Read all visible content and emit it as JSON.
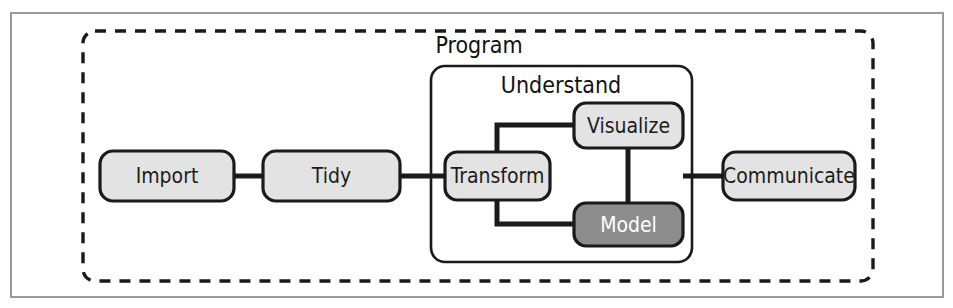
{
  "figure": {
    "canvas": {
      "width": 953,
      "height": 308,
      "background": "#ffffff"
    },
    "frame": {
      "name": "outer-frame",
      "x": 11,
      "y": 13,
      "width": 932,
      "height": 284,
      "stroke": "#9a9a9a",
      "stroke_width": 2,
      "fill": "#ffffff"
    },
    "colors": {
      "node_fill": "#e3e3e3",
      "node_stroke": "#1a1a1a",
      "node_text": "#1c1c1c",
      "highlight_fill": "#8d8d8d",
      "highlight_text": "#ffffff",
      "group_stroke": "#1a1a1a",
      "dashed_stroke": "#1a1a1a",
      "connector_stroke": "#1a1a1a",
      "frame_stroke": "#9a9a9a"
    },
    "groups": [
      {
        "id": "program",
        "label": "Program",
        "style": "dashed",
        "x": 83,
        "y": 31,
        "width": 790,
        "height": 250,
        "rx": 12,
        "label_x": 479,
        "label_y": 46
      },
      {
        "id": "understand",
        "label": "Understand",
        "style": "solid",
        "x": 431,
        "y": 66,
        "width": 261,
        "height": 196,
        "rx": 14,
        "label_x": 561,
        "label_y": 86
      }
    ],
    "nodes": [
      {
        "id": "import",
        "label": "Import",
        "x": 100,
        "y": 151,
        "width": 134,
        "height": 50,
        "rx": 13,
        "variant": "light"
      },
      {
        "id": "tidy",
        "label": "Tidy",
        "x": 263,
        "y": 151,
        "width": 137,
        "height": 50,
        "rx": 13,
        "variant": "light"
      },
      {
        "id": "transform",
        "label": "Transform",
        "x": 445,
        "y": 152,
        "width": 105,
        "height": 48,
        "rx": 12,
        "variant": "light"
      },
      {
        "id": "visualize",
        "label": "Visualize",
        "x": 574,
        "y": 103,
        "width": 109,
        "height": 45,
        "rx": 12,
        "variant": "light"
      },
      {
        "id": "model",
        "label": "Model",
        "x": 574,
        "y": 203,
        "width": 109,
        "height": 43,
        "rx": 12,
        "variant": "dark"
      },
      {
        "id": "communicate",
        "label": "Communicate",
        "x": 723,
        "y": 152,
        "width": 132,
        "height": 48,
        "rx": 13,
        "variant": "light"
      }
    ],
    "connectors": [
      {
        "id": "import-to-tidy",
        "from": "import",
        "to": "tidy",
        "points": "234,176 263,176"
      },
      {
        "id": "tidy-to-transform",
        "from": "tidy",
        "to": "transform",
        "points": "400,176 445,176"
      },
      {
        "id": "transform-to-visualize",
        "from": "transform",
        "to": "visualize",
        "points": "497,176 497,125 574,125"
      },
      {
        "id": "transform-to-model",
        "from": "transform",
        "to": "model",
        "points": "497,176 497,224 574,224"
      },
      {
        "id": "visualize-to-model",
        "from": "visualize",
        "to": "model",
        "points": "628,148 628,203"
      },
      {
        "id": "understand-to-communicate",
        "from": "understand",
        "to": "communicate",
        "points": "683,176 723,176"
      }
    ]
  }
}
